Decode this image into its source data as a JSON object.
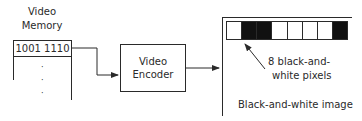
{
  "memory": {
    "title_line1": "Video",
    "title_line2": "Memory",
    "cell_value": "1001 1110",
    "ellipsis": [
      "·",
      "·",
      "·"
    ]
  },
  "encoder": {
    "line1": "Video",
    "line2": "Encoder"
  },
  "image": {
    "pixels": [
      "white",
      "black",
      "black",
      "white",
      "white",
      "white",
      "white",
      "black"
    ],
    "annotation_line1": "8 black-and-",
    "annotation_line2": "white pixels",
    "caption": "Black-and-white image"
  },
  "colors": {
    "line": "#2a2a2a",
    "black_pixel": "#111111",
    "white_pixel": "#ffffff"
  }
}
